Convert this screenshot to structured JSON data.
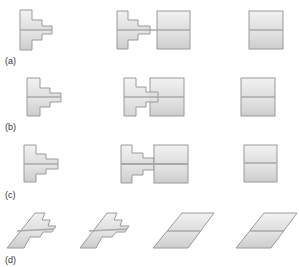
{
  "figure": {
    "panels": [
      {
        "label": "(a)",
        "description": "Stepped T-shaped element, element adjacent to square block, square block alone"
      },
      {
        "label": "(b)",
        "description": "Stepped T-shaped element, element overlapping square block, square block alone"
      },
      {
        "label": "(c)",
        "description": "Stepped T-shaped element, element joined to square block by neck, square block alone"
      },
      {
        "label": "(d)",
        "description": "Sheared stepped elements and sheared parallelogram blocks"
      }
    ]
  },
  "colors": {
    "fill_light": "#efefef",
    "fill_dark": "#cfcfcf",
    "stroke": "#9a9a9a",
    "midline": "#a8a8a8",
    "label": "#333333"
  }
}
